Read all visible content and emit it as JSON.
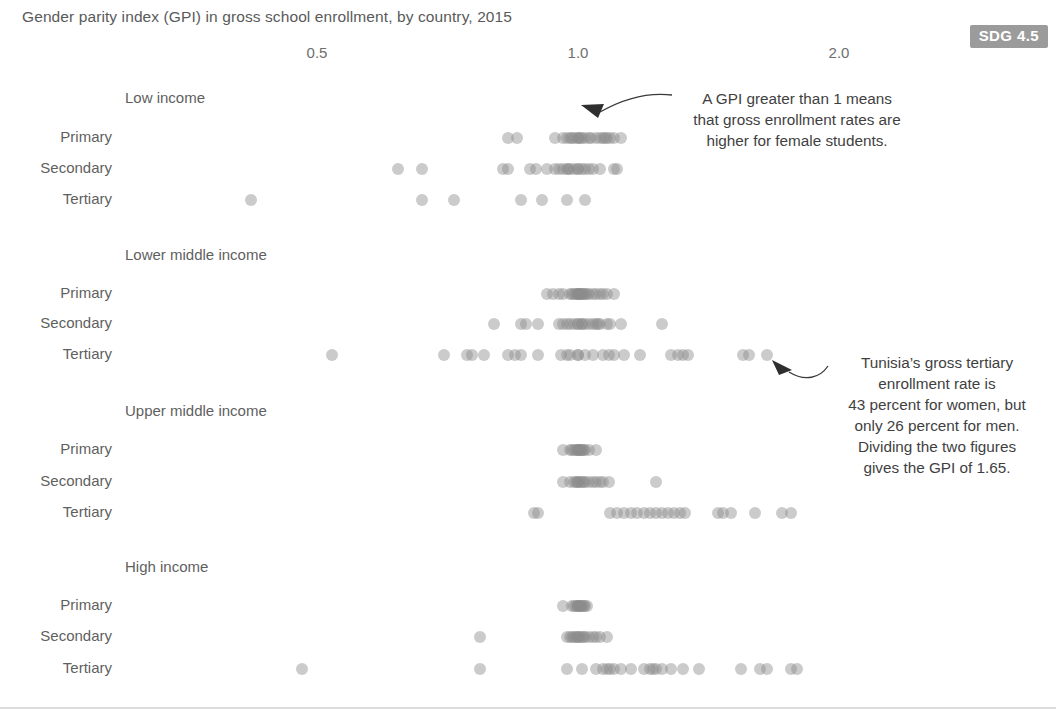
{
  "title": "Gender parity index (GPI) in gross school enrollment, by country, 2015",
  "badge": {
    "label": "SDG 4.5"
  },
  "annotations": {
    "first": "A GPI greater than 1 means\nthat gross enrollment rates are\nhigher for female students.",
    "second": "Tunisia’s gross tertiary\nenrollment rate is\n43 percent for women, but\nonly 26 percent for men.\nDividing the two figures\ngives the GPI of 1.65."
  },
  "colors": {
    "dot": "#8c8c8c",
    "text": "#5f5f5f",
    "badge_bg": "#9b9b9b",
    "baseline": "#dcdcdc",
    "arrow": "#3a3a3a"
  },
  "chart_data": {
    "type": "scatter",
    "title": "Gender parity index (GPI) in gross school enrollment, by country, 2015",
    "xlabel": "Gender parity index (GPI)",
    "ylabel": "",
    "scale": "log",
    "xlim": [
      0.35,
      2.6
    ],
    "grid": false,
    "legend": null,
    "xticks": [
      0.5,
      1.0,
      2.0
    ],
    "xticklabels": [
      "0.5",
      "1.0",
      "2.0"
    ],
    "groups": [
      {
        "name": "Low income",
        "rows": [
          {
            "label": "Primary",
            "values": [
              0.83,
              0.85,
              0.94,
              0.96,
              0.97,
              0.98,
              0.985,
              0.99,
              1.0,
              1.0,
              1.005,
              1.01,
              1.02,
              1.03,
              1.035,
              1.05,
              1.06,
              1.07,
              1.075,
              1.08,
              1.09,
              1.1,
              1.12
            ]
          },
          {
            "label": "Secondary",
            "values": [
              0.62,
              0.66,
              0.82,
              0.83,
              0.88,
              0.895,
              0.92,
              0.94,
              0.95,
              0.96,
              0.97,
              0.975,
              0.98,
              0.99,
              1.0,
              1.0,
              1.01,
              1.02,
              1.03,
              1.04,
              1.06,
              1.1,
              1.11
            ]
          },
          {
            "label": "Tertiary",
            "values": [
              0.42,
              0.66,
              0.72,
              0.86,
              0.91,
              0.97,
              1.02
            ]
          }
        ]
      },
      {
        "name": "Lower middle income",
        "rows": [
          {
            "label": "Primary",
            "values": [
              0.92,
              0.935,
              0.95,
              0.96,
              0.98,
              0.985,
              0.99,
              0.995,
              1.0,
              1.0,
              1.0,
              1.005,
              1.005,
              1.01,
              1.01,
              1.015,
              1.02,
              1.025,
              1.03,
              1.04,
              1.05,
              1.06,
              1.07,
              1.08,
              1.1
            ]
          },
          {
            "label": "Secondary",
            "values": [
              0.8,
              0.86,
              0.87,
              0.9,
              0.95,
              0.96,
              0.97,
              0.98,
              0.99,
              1.0,
              1.0,
              1.01,
              1.01,
              1.02,
              1.03,
              1.04,
              1.05,
              1.055,
              1.06,
              1.08,
              1.09,
              1.12,
              1.25
            ]
          },
          {
            "label": "Tertiary",
            "values": [
              0.52,
              0.7,
              0.745,
              0.755,
              0.78,
              0.83,
              0.845,
              0.86,
              0.9,
              0.955,
              0.97,
              0.98,
              1.0,
              1.0,
              1.02,
              1.04,
              1.07,
              1.085,
              1.1,
              1.13,
              1.18,
              1.28,
              1.305,
              1.32,
              1.34,
              1.55,
              1.575,
              1.65
            ]
          }
        ]
      },
      {
        "name": "Upper middle income",
        "rows": [
          {
            "label": "Primary",
            "values": [
              0.96,
              0.98,
              0.985,
              0.99,
              0.995,
              1.0,
              1.0,
              1.0,
              1.005,
              1.005,
              1.01,
              1.01,
              1.015,
              1.02,
              1.03,
              1.05
            ]
          },
          {
            "label": "Secondary",
            "values": [
              0.96,
              0.98,
              0.99,
              0.995,
              1.0,
              1.0,
              1.005,
              1.01,
              1.015,
              1.02,
              1.03,
              1.04,
              1.05,
              1.06,
              1.07,
              1.085,
              1.23
            ]
          },
          {
            "label": "Tertiary",
            "values": [
              0.89,
              0.9,
              1.09,
              1.11,
              1.13,
              1.15,
              1.17,
              1.19,
              1.21,
              1.23,
              1.25,
              1.27,
              1.29,
              1.31,
              1.33,
              1.45,
              1.47,
              1.5,
              1.6,
              1.72,
              1.76
            ]
          }
        ]
      },
      {
        "name": "High income",
        "rows": [
          {
            "label": "Primary",
            "values": [
              0.96,
              0.985,
              0.99,
              0.995,
              1.0,
              1.0,
              1.0,
              1.005,
              1.005,
              1.01,
              1.01,
              1.015,
              1.02,
              1.025
            ]
          },
          {
            "label": "Secondary",
            "values": [
              0.77,
              0.97,
              0.98,
              0.985,
              0.99,
              0.995,
              1.0,
              1.0,
              1.005,
              1.01,
              1.015,
              1.02,
              1.03,
              1.04,
              1.05,
              1.06,
              1.08
            ]
          },
          {
            "label": "Tertiary",
            "values": [
              0.48,
              0.77,
              0.97,
              1.01,
              1.05,
              1.07,
              1.08,
              1.09,
              1.1,
              1.12,
              1.15,
              1.19,
              1.21,
              1.22,
              1.23,
              1.25,
              1.28,
              1.32,
              1.38,
              1.54,
              1.62,
              1.65,
              1.76,
              1.79
            ]
          }
        ]
      }
    ]
  }
}
